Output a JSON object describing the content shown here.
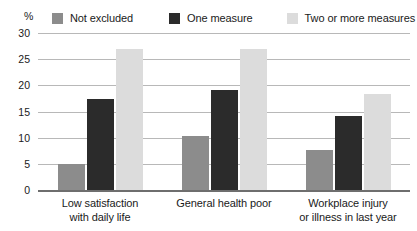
{
  "clipped_caption": "",
  "axis_unit": "%",
  "legend": {
    "items": [
      {
        "label": "Not excluded",
        "color": "#8c8c8c"
      },
      {
        "label": "One measure",
        "color": "#2b2b2b"
      },
      {
        "label": "Two or more measures",
        "color": "#dcdcdc"
      }
    ]
  },
  "yticks": [
    "30",
    "25",
    "20",
    "15",
    "10",
    "5",
    "0"
  ],
  "chart_data": {
    "type": "bar",
    "title": "",
    "xlabel": "",
    "ylabel": "%",
    "ylim": [
      0,
      30
    ],
    "ytick_values": [
      0,
      5,
      10,
      15,
      20,
      25,
      30
    ],
    "grid": true,
    "legend_position": "top",
    "categories": [
      "Low satisfaction with daily life",
      "General health poor",
      "Workplace injury or illness in last year"
    ],
    "category_lines": [
      [
        "Low satisfaction",
        "with daily life"
      ],
      [
        "General health poor",
        ""
      ],
      [
        "Workplace injury",
        "or illness in last year"
      ]
    ],
    "series": [
      {
        "name": "Not excluded",
        "color": "#8c8c8c",
        "values": [
          4.9,
          10.3,
          7.6
        ]
      },
      {
        "name": "One measure",
        "color": "#2b2b2b",
        "values": [
          17.3,
          19.1,
          14.2
        ]
      },
      {
        "name": "Two or more measures",
        "color": "#dcdcdc",
        "values": [
          27.0,
          27.0,
          18.3
        ]
      }
    ]
  }
}
